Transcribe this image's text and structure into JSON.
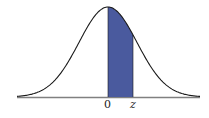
{
  "diagram": {
    "type": "standard-normal-curve",
    "shaded_region": {
      "from": "0",
      "to": "z"
    },
    "colors": {
      "fill": "#4a5a9e",
      "curve": "#1a1a1a",
      "axis": "#808080"
    },
    "labels": {
      "zero": "0",
      "z": "z"
    }
  }
}
